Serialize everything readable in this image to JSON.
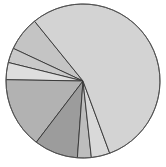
{
  "chart_data": {
    "type": "pie",
    "title": "",
    "legend": [],
    "center": [
      83,
      81
    ],
    "radius": 77,
    "start_angle_deg": 129,
    "direction": "counterclockwise",
    "slices": [
      {
        "label": "",
        "value": 7.2,
        "color": "#c4c4c4"
      },
      {
        "label": "",
        "value": 3.1,
        "color": "#c9c9c9"
      },
      {
        "label": "",
        "value": 3.6,
        "color": "#dedede"
      },
      {
        "label": "",
        "value": 14.9,
        "color": "#b2b2b2"
      },
      {
        "label": "",
        "value": 9.2,
        "color": "#9c9c9c"
      },
      {
        "label": "",
        "value": 2.9,
        "color": "#bdbdbd"
      },
      {
        "label": "",
        "value": 3.9,
        "color": "#d9d9d9"
      },
      {
        "label": "",
        "value": 55.2,
        "color": "#d3d3d3"
      }
    ]
  }
}
